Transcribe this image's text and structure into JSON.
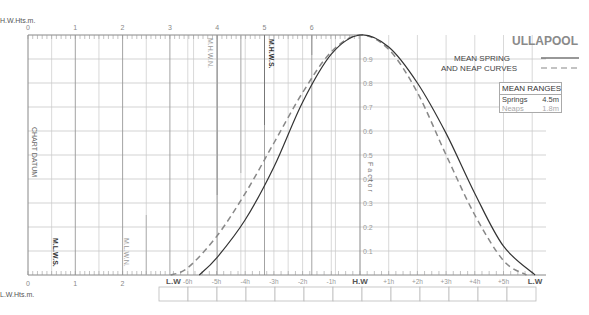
{
  "title": "ULLAPOOL",
  "legend": {
    "line1": "MEAN SPRING",
    "line2": "AND NEAP CURVES",
    "spring_style": "solid",
    "neap_style": "dashed"
  },
  "mean_ranges": {
    "header": "MEAN RANGES",
    "springs_label": "Springs",
    "springs_value": "4.5m",
    "neaps_label": "Neaps",
    "neaps_value": "1.8m"
  },
  "axes": {
    "top_label": "H.W.Hts.m.",
    "bottom_label": "L.W.Hts.m.",
    "top_ticks": [
      "0",
      "1",
      "2",
      "3",
      "4",
      "5",
      "6"
    ],
    "bottom_ticks": [
      "0",
      "1",
      "2"
    ],
    "chart_datum": "CHART DATUM",
    "factor_label": "Factor",
    "factor_ticks": [
      "0.9",
      "0.8",
      "0.7",
      "0.6",
      "0.5",
      "0.4",
      "0.3",
      "0.2",
      "0.1"
    ],
    "markers": {
      "mhws": "M.H.W.S.",
      "mhwn": "M.H.W.N.",
      "mlws": "M.L.W.S.",
      "mlwn": "M.L.W.N."
    },
    "hour_labels": [
      "L.W",
      "-6h",
      "-5h",
      "-4h",
      "-3h",
      "-2h",
      "-1h",
      "H.W",
      "+1h",
      "+2h",
      "+3h",
      "+4h",
      "+5h",
      "L.W"
    ]
  },
  "colors": {
    "spring": "#333333",
    "neap": "#888888",
    "grid": "#c8c8c8",
    "grid_major": "#999999"
  },
  "chart_data": {
    "type": "line",
    "title": "ULLAPOOL",
    "xlabel": "Hours relative to H.W",
    "ylabel": "Factor",
    "x": [
      -6.5,
      -6,
      -5,
      -4,
      -3,
      -2,
      -1,
      0,
      1,
      2,
      3,
      4,
      5,
      6.1
    ],
    "categories": [
      "L.W",
      "-6h",
      "-5h",
      "-4h",
      "-3h",
      "-2h",
      "-1h",
      "H.W",
      "+1h",
      "+2h",
      "+3h",
      "+4h",
      "+5h",
      "L.W"
    ],
    "series": [
      {
        "name": "Mean Spring (solid)",
        "values": [
          0,
          0,
          0.07,
          0.23,
          0.45,
          0.72,
          0.92,
          1.0,
          0.95,
          0.8,
          0.59,
          0.34,
          0.12,
          0
        ]
      },
      {
        "name": "Mean Neap (dashed)",
        "values": [
          0,
          0.03,
          0.16,
          0.34,
          0.55,
          0.76,
          0.93,
          1.0,
          0.94,
          0.76,
          0.5,
          0.25,
          0.06,
          0
        ]
      }
    ],
    "ylim": [
      0,
      1
    ],
    "height_scale_m": [
      0,
      6
    ],
    "mean_ranges": {
      "springs_m": 4.5,
      "neaps_m": 1.8
    },
    "grid": true,
    "legend_position": "top-right"
  }
}
